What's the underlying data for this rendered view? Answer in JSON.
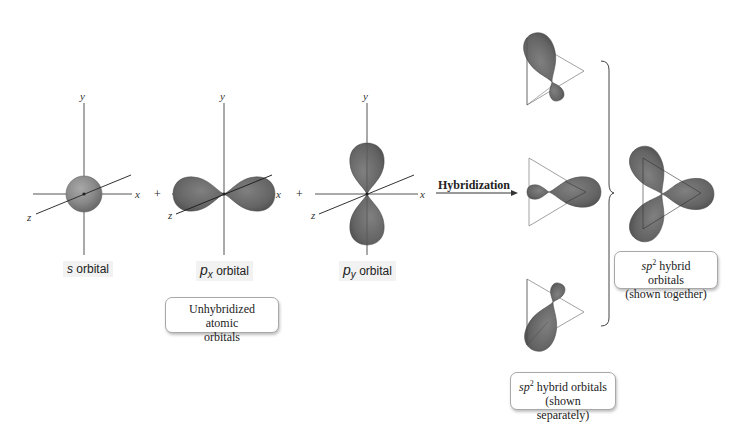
{
  "diagram": {
    "type": "sp2 hybridization",
    "colors": {
      "lobe_fill": "#6d6d6d",
      "lobe_dark": "#4f4f4f",
      "sphere_fill": "#8a8a8a",
      "axis": "#555555",
      "triangle": "#8a8a8a",
      "callout_border": "#a8a8a8",
      "label_bg": "#f2f2f2"
    },
    "axes": {
      "x": "x",
      "y": "y",
      "z": "z"
    },
    "operators": [
      "+",
      "+"
    ],
    "orbitals": [
      {
        "id": "s",
        "prefix": "s",
        "subscript": "",
        "suffix": " orbital"
      },
      {
        "id": "px",
        "prefix": "p",
        "subscript": "x",
        "suffix": " orbital"
      },
      {
        "id": "py",
        "prefix": "p",
        "subscript": "y",
        "suffix": " orbital"
      }
    ],
    "unhybridized_callout": {
      "line1": "Unhybridized atomic",
      "line2": "orbitals"
    },
    "arrow_label": "Hybridization",
    "separate_callout": {
      "sp": "sp",
      "sup": "2",
      "line1_rest": " hybrid orbitals",
      "line2": "(shown separately)"
    },
    "together_callout": {
      "sp": "sp",
      "sup": "2",
      "line1_rest": " hybrid orbitals",
      "line2": "(shown together)"
    }
  }
}
